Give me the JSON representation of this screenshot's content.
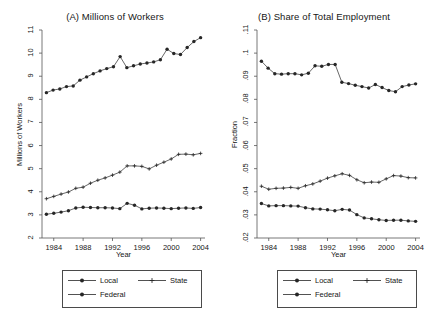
{
  "figure": {
    "background": "#ffffff",
    "series_color": "#262626"
  },
  "panels": [
    {
      "key": "a",
      "title": "(A) Millions of Workers",
      "ylabel": "Millions of Workers",
      "xlabel": "Year",
      "yticks": [
        "2",
        "3",
        "4",
        "5",
        "6",
        "7",
        "8",
        "9",
        "10",
        "11"
      ],
      "xticks": [
        "1984",
        "1988",
        "1992",
        "1996",
        "2000",
        "2004"
      ]
    },
    {
      "key": "b",
      "title": "(B) Share of Total Employment",
      "ylabel": "Fraction",
      "xlabel": "Year",
      "yticks": [
        ".02",
        ".03",
        ".04",
        ".05",
        ".06",
        ".07",
        ".08",
        ".09",
        ".1",
        ".11"
      ],
      "xticks": [
        "1984",
        "1988",
        "1992",
        "1996",
        "2000",
        "2004"
      ]
    }
  ],
  "legend": {
    "entries": [
      {
        "label": "Local",
        "marker": "circle",
        "name": "legend-item-local"
      },
      {
        "label": "Federal",
        "marker": "circle",
        "name": "legend-item-federal"
      },
      {
        "label": "State",
        "marker": "plus",
        "name": "legend-item-state"
      }
    ]
  },
  "chart_data": [
    {
      "type": "line",
      "panel": "A",
      "title": "(A) Millions of Workers",
      "xlabel": "Year",
      "ylabel": "Millions of Workers",
      "xlim": [
        1982.4,
        2004.6
      ],
      "ylim": [
        2,
        11
      ],
      "xticks": [
        1984,
        1988,
        1992,
        1996,
        2000,
        2004
      ],
      "yticks": [
        2,
        3,
        4,
        5,
        6,
        7,
        8,
        9,
        10,
        11
      ],
      "grid": false,
      "legend_position": "below",
      "x": [
        1983,
        1984,
        1985,
        1986,
        1987,
        1988,
        1989,
        1990,
        1991,
        1992,
        1993,
        1994,
        1995,
        1996,
        1997,
        1998,
        1999,
        2000,
        2001,
        2002,
        2003,
        2004
      ],
      "series": [
        {
          "name": "Local",
          "marker": "circle",
          "values": [
            8.29,
            8.4,
            8.45,
            8.55,
            8.58,
            8.83,
            8.97,
            9.11,
            9.23,
            9.33,
            9.41,
            9.85,
            9.37,
            9.45,
            9.53,
            9.57,
            9.62,
            9.71,
            10.17,
            9.98,
            9.94,
            10.24,
            10.5,
            10.67
          ]
        },
        {
          "name": "State",
          "marker": "plus",
          "values": [
            3.7,
            3.8,
            3.9,
            3.99,
            4.15,
            4.2,
            4.37,
            4.5,
            4.6,
            4.72,
            4.85,
            5.12,
            5.12,
            5.1,
            4.99,
            5.15,
            5.28,
            5.42,
            5.62,
            5.63,
            5.6,
            5.66
          ]
        },
        {
          "name": "Federal",
          "marker": "circle",
          "values": [
            3.03,
            3.07,
            3.12,
            3.18,
            3.3,
            3.33,
            3.32,
            3.31,
            3.31,
            3.3,
            3.27,
            3.5,
            3.42,
            3.26,
            3.29,
            3.3,
            3.29,
            3.27,
            3.29,
            3.3,
            3.28,
            3.32
          ]
        }
      ]
    },
    {
      "type": "line",
      "panel": "B",
      "title": "(B) Share of Total Employment",
      "xlabel": "Year",
      "ylabel": "Fraction",
      "xlim": [
        1982.4,
        2004.6
      ],
      "ylim": [
        0.02,
        0.11
      ],
      "xticks": [
        1984,
        1988,
        1992,
        1996,
        2000,
        2004
      ],
      "yticks": [
        0.02,
        0.03,
        0.04,
        0.05,
        0.06,
        0.07,
        0.08,
        0.09,
        0.1,
        0.11
      ],
      "grid": false,
      "legend_position": "below",
      "x": [
        1983,
        1984,
        1985,
        1986,
        1987,
        1988,
        1989,
        1990,
        1991,
        1992,
        1993,
        1994,
        1995,
        1996,
        1997,
        1998,
        1999,
        2000,
        2001,
        2002,
        2003,
        2004
      ],
      "series": [
        {
          "name": "Local",
          "marker": "circle",
          "values": [
            0.0965,
            0.0935,
            0.0911,
            0.0909,
            0.0911,
            0.0911,
            0.0906,
            0.0913,
            0.0945,
            0.0943,
            0.0951,
            0.0951,
            0.0874,
            0.0868,
            0.0861,
            0.0855,
            0.0849,
            0.0864,
            0.0851,
            0.0838,
            0.0833,
            0.0855,
            0.0862,
            0.0867
          ]
        },
        {
          "name": "State",
          "marker": "plus",
          "values": [
            0.0424,
            0.0411,
            0.0415,
            0.0416,
            0.0419,
            0.0415,
            0.0426,
            0.0434,
            0.0446,
            0.0459,
            0.0469,
            0.0478,
            0.0471,
            0.0452,
            0.0439,
            0.0442,
            0.0441,
            0.0456,
            0.047,
            0.0468,
            0.0461,
            0.046
          ]
        },
        {
          "name": "Federal",
          "marker": "circle",
          "values": [
            0.0349,
            0.0339,
            0.034,
            0.034,
            0.0339,
            0.0338,
            0.0331,
            0.0326,
            0.0325,
            0.0322,
            0.0318,
            0.0324,
            0.0321,
            0.0301,
            0.0287,
            0.0283,
            0.0279,
            0.0276,
            0.0277,
            0.0277,
            0.0274,
            0.0272
          ]
        }
      ]
    }
  ]
}
